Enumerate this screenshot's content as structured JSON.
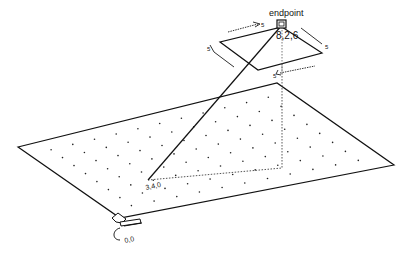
{
  "diagram": {
    "endpoint_label": "endpoint",
    "endpoint_coords": "8,2,6",
    "start_coords": "3,4,0",
    "origin_label": "0,0",
    "dimension_labels": {
      "top_left": "5",
      "left": "5",
      "right": "5",
      "bottom": "5"
    },
    "colors": {
      "line": "#111111",
      "dotted": "#555555",
      "dots": "#222222",
      "background": "#ffffff"
    },
    "ground_plane": {
      "corners": [
        [
          18,
          147
        ],
        [
          277,
          83
        ],
        [
          394,
          165
        ],
        [
          120,
          218
        ]
      ],
      "grid_rows": 9,
      "grid_cols": 12
    },
    "small_plane": {
      "corners": [
        [
          282,
          27
        ],
        [
          322,
          53
        ],
        [
          258,
          70
        ],
        [
          220,
          42
        ]
      ]
    },
    "start_point": [
      148,
      180
    ],
    "endpoint_point": [
      282,
      25
    ],
    "projection_corner": [
      282,
      168
    ]
  }
}
